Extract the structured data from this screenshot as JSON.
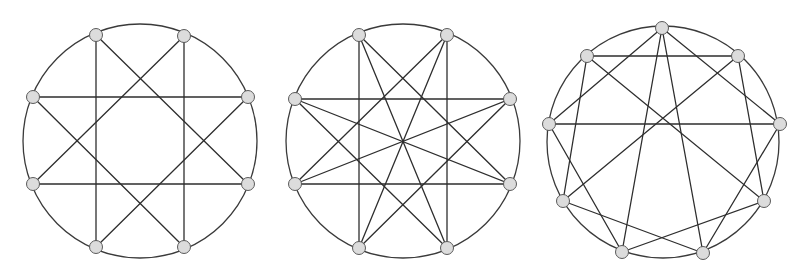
{
  "figure": {
    "width": 805,
    "height": 275,
    "colors": {
      "background": "#ffffff",
      "edge": "#2e2e2e",
      "circle": "#3a3a3a",
      "vertex_fill": "#dcdcdc",
      "vertex_stroke": "#5a5a5a"
    },
    "vertex_radius": 6.5
  },
  "graphs": [
    {
      "name": "graph-1-star-8-3",
      "description": "8 vertices on a circle, each joined to vertices 3 steps away ({8/3} star) plus circle",
      "circle": {
        "cx": 140,
        "cy": 141,
        "r": 117
      },
      "vertices": [
        [
          96,
          35
        ],
        [
          184,
          36
        ],
        [
          248,
          97
        ],
        [
          248,
          184
        ],
        [
          184,
          247
        ],
        [
          96,
          247
        ],
        [
          33,
          184
        ],
        [
          33,
          97
        ]
      ],
      "edges": [
        [
          0,
          3
        ],
        [
          1,
          4
        ],
        [
          2,
          5
        ],
        [
          3,
          6
        ],
        [
          4,
          7
        ],
        [
          5,
          0
        ],
        [
          6,
          1
        ],
        [
          7,
          2
        ]
      ]
    },
    {
      "name": "graph-2-star-8-3-with-diameters",
      "description": "8 vertices on a circle, {8/3} star plus the 4 diameters",
      "circle": {
        "cx": 403,
        "cy": 141,
        "r": 117
      },
      "vertices": [
        [
          359,
          35
        ],
        [
          447,
          35
        ],
        [
          510,
          99
        ],
        [
          510,
          184
        ],
        [
          447,
          248
        ],
        [
          359,
          248
        ],
        [
          295,
          184
        ],
        [
          295,
          99
        ]
      ],
      "edges": [
        [
          0,
          3
        ],
        [
          1,
          4
        ],
        [
          2,
          5
        ],
        [
          3,
          6
        ],
        [
          4,
          7
        ],
        [
          5,
          0
        ],
        [
          6,
          1
        ],
        [
          7,
          2
        ],
        [
          0,
          4
        ],
        [
          1,
          5
        ],
        [
          2,
          6
        ],
        [
          3,
          7
        ]
      ]
    },
    {
      "name": "graph-3-nine-vertex",
      "description": "9 vertices on a circle with chords",
      "circle": {
        "cx": 663,
        "cy": 142,
        "r": 116
      },
      "vertices": [
        [
          662,
          28
        ],
        [
          738,
          56
        ],
        [
          780,
          124
        ],
        [
          764,
          201
        ],
        [
          703,
          253
        ],
        [
          622,
          252
        ],
        [
          563,
          201
        ],
        [
          549,
          124
        ],
        [
          587,
          56
        ]
      ],
      "edges": [
        [
          0,
          7
        ],
        [
          0,
          2
        ],
        [
          0,
          5
        ],
        [
          0,
          4
        ],
        [
          1,
          8
        ],
        [
          1,
          6
        ],
        [
          1,
          3
        ],
        [
          2,
          7
        ],
        [
          2,
          4
        ],
        [
          3,
          8
        ],
        [
          3,
          5
        ],
        [
          4,
          6
        ],
        [
          5,
          7
        ],
        [
          6,
          8
        ]
      ]
    }
  ]
}
